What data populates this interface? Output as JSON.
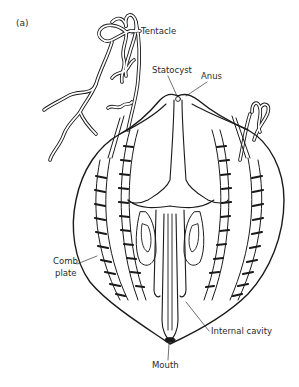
{
  "figure": {
    "panel_label": "(a)",
    "labels": {
      "tentacle": "Tentacle",
      "statocyst": "Statocyst",
      "anus": "Anus",
      "comb_plate_line1": "Comb",
      "comb_plate_line2": "plate",
      "internal_cavity": "Internal cavity",
      "mouth": "Mouth"
    },
    "colors": {
      "ink": "#1a1a1a",
      "label_text": "#2a2a2a",
      "background": "#ffffff"
    }
  }
}
